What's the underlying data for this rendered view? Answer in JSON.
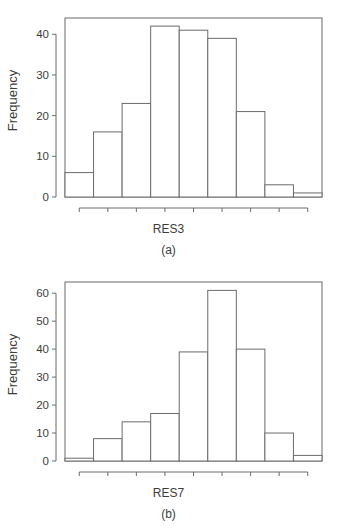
{
  "figure": {
    "panels": [
      {
        "id": "a",
        "caption": "(a)",
        "ylabel": "Frequency",
        "xlabel": "RES3"
      },
      {
        "id": "b",
        "caption": "(b)",
        "ylabel": "Frequency",
        "xlabel": "RES7"
      }
    ]
  },
  "chart_data": [
    {
      "type": "bar",
      "title": "",
      "panel": "(a)",
      "xlabel": "RES3",
      "ylabel": "Frequency",
      "bin_edges": [
        1550,
        1650,
        1750,
        1850,
        1950,
        2050,
        2150,
        2250,
        2350,
        2450
      ],
      "bin_centers": [
        1600,
        1700,
        1800,
        1900,
        2000,
        2100,
        2200,
        2300,
        2400
      ],
      "values": [
        6,
        16,
        23,
        42,
        41,
        39,
        21,
        3,
        1
      ],
      "xticks": [
        1600,
        1700,
        1800,
        1900,
        2000,
        2100,
        2200,
        2300,
        2400
      ],
      "yticks": [
        0,
        10,
        20,
        30,
        40
      ],
      "xlim": [
        1550,
        2450
      ],
      "ylim": [
        0,
        44
      ],
      "grid": false,
      "legend": false
    },
    {
      "type": "bar",
      "title": "",
      "panel": "(b)",
      "xlabel": "RES7",
      "ylabel": "Frequency",
      "bin_edges": [
        1350,
        1450,
        1550,
        1650,
        1750,
        1850,
        1950,
        2050,
        2150,
        2250
      ],
      "bin_centers": [
        1400,
        1500,
        1600,
        1700,
        1800,
        1900,
        2000,
        2100,
        2200
      ],
      "values": [
        1,
        8,
        14,
        17,
        39,
        61,
        40,
        10,
        2
      ],
      "xticks": [
        1400,
        1500,
        1600,
        1700,
        1800,
        1900,
        2000,
        2100,
        2200
      ],
      "yticks": [
        0,
        10,
        20,
        30,
        40,
        50,
        60
      ],
      "xlim": [
        1350,
        2250
      ],
      "ylim": [
        0,
        64
      ],
      "grid": false,
      "legend": false
    }
  ]
}
